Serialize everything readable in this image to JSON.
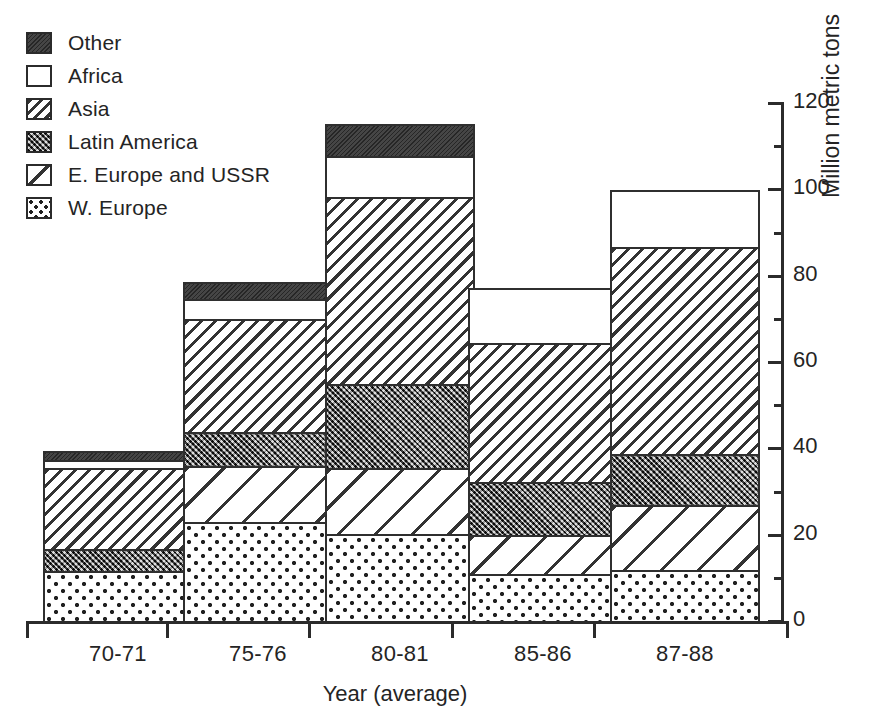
{
  "chart_data": {
    "type": "bar",
    "subtype": "stacked-vertical",
    "title": "",
    "xlabel": "Year (average)",
    "ylabel": "Million metric tons",
    "categories": [
      "70-71",
      "75-76",
      "80-81",
      "85-86",
      "87-88"
    ],
    "ylim": [
      0,
      120
    ],
    "yticks_major": [
      0,
      20,
      40,
      60,
      80,
      100,
      120
    ],
    "yticks_minor": [
      10,
      30,
      50,
      70,
      90,
      110
    ],
    "ytick_labels": [
      "0",
      "20",
      "40",
      "60",
      "80",
      "100",
      "120"
    ],
    "grid": false,
    "legend_position": "top-left",
    "stack_order_bottom_to_top": [
      "W. Europe",
      "E. Europe and USSR",
      "Latin America",
      "Asia",
      "Africa",
      "Other"
    ],
    "series": [
      {
        "name": "W. Europe",
        "pattern": "dots",
        "values": [
          11.6,
          23.0,
          20.2,
          10.9,
          11.9
        ]
      },
      {
        "name": "E. Europe and USSR",
        "pattern": "wide-diagonal",
        "values": [
          0.0,
          12.8,
          15.3,
          9.1,
          14.9
        ]
      },
      {
        "name": "Latin America",
        "pattern": "crosshatch",
        "values": [
          5.1,
          8.1,
          19.3,
          12.3,
          11.9
        ]
      },
      {
        "name": "Asia",
        "pattern": "diagonal",
        "values": [
          18.8,
          26.0,
          43.5,
          32.1,
          47.9
        ]
      },
      {
        "name": "Africa",
        "pattern": "solid-white",
        "values": [
          1.9,
          4.7,
          9.5,
          12.8,
          13.3
        ]
      },
      {
        "name": "Other",
        "pattern": "solid-black",
        "values": [
          1.9,
          4.0,
          7.4,
          0.0,
          0.0
        ]
      }
    ],
    "totals": [
      39.3,
      78.6,
      115.2,
      77.2,
      99.9
    ]
  },
  "legend": {
    "items": [
      {
        "label": "Other",
        "pattern": "solid-black"
      },
      {
        "label": "Africa",
        "pattern": "solid-white"
      },
      {
        "label": "Asia",
        "pattern": "diagonal"
      },
      {
        "label": "Latin America",
        "pattern": "crosshatch"
      },
      {
        "label": "E. Europe and USSR",
        "pattern": "wide-diagonal"
      },
      {
        "label": "W. Europe",
        "pattern": "dots"
      }
    ]
  },
  "colors": {
    "ink": "#2b2b2b",
    "background": "#ffffff",
    "other_fill": "#3a3a3a",
    "latin_fill": "#5d5d5d"
  }
}
